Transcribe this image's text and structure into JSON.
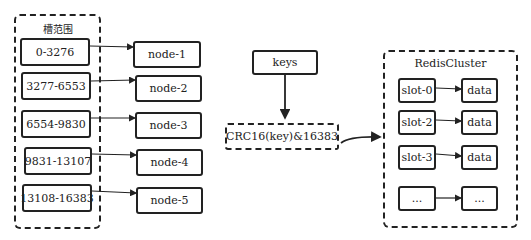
{
  "slot_ranges": {
    "title": "槽范围",
    "items": [
      "0-3276",
      "3277-6553",
      "6554-9830",
      "9831-13107",
      "13108-16383"
    ]
  },
  "nodes": [
    "node-1",
    "node-2",
    "node-3",
    "node-4",
    "node-5"
  ],
  "hashing": {
    "input_label": "keys",
    "function_label": "CRC16(key)&16383"
  },
  "cluster": {
    "title": "RedisCluster",
    "rows": [
      {
        "slot": "slot-0",
        "data": "data"
      },
      {
        "slot": "slot-2",
        "data": "data"
      },
      {
        "slot": "slot-3",
        "data": "data"
      },
      {
        "slot": "...",
        "data": "..."
      }
    ]
  }
}
